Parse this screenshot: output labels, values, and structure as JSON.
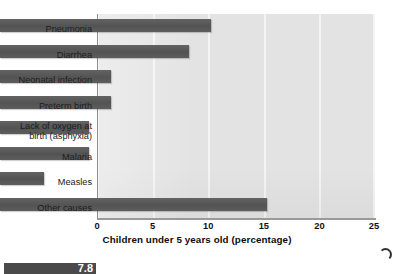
{
  "chart_data": {
    "type": "bar",
    "orientation": "horizontal",
    "title": "",
    "xlabel": "Children under 5 years old (percentage)",
    "ylabel": "",
    "xlim": [
      0,
      25
    ],
    "xticks": [
      0,
      5,
      10,
      15,
      20,
      25
    ],
    "grid": "vertical-white-gridlines",
    "legend": "none",
    "categories": [
      "Pneumonia",
      "Diarrhea",
      "Neonatal infection",
      "Preterm birth",
      "Lack of oxygen at\nbirth (asphyxia)",
      "Malaria",
      "Measles",
      "Other causes"
    ],
    "values": [
      19,
      17,
      10,
      10,
      8,
      8,
      4,
      24
    ],
    "bar_color": "#585858",
    "plot_background": "#e3e3e3",
    "gridline_color": "#f4f4f4"
  },
  "caption": {
    "figure_number": "7.8"
  }
}
